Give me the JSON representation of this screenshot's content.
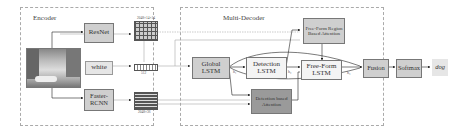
{
  "encoder": {
    "title": "Encoder",
    "resnet_label": "ResNet",
    "text_input_label": "white",
    "faster_rcnn_label": "Faster-RCNN",
    "feature_map_dim": "2048×14×14",
    "word_embed_dim": "512",
    "region_feature_dim": "2048×36"
  },
  "decoder": {
    "title": "Multi-Decoder",
    "global_lstm_label": "Global LSTM",
    "detection_lstm_label": "Detection LSTM",
    "freeform_lstm_label": "Free-Form LSTM",
    "freeform_attention_label": "Free-Form Region Based Attention",
    "detection_attention_label": "Detection based Attention",
    "fusion_label": "Fusion",
    "softmax_label": "Softmax",
    "output_word": "dog",
    "h_global": "h₁",
    "h_detection": "h₂",
    "h_freeform": "h₃",
    "h_global_out": "h₁ᵗ",
    "h_detection_out": "h₂ᵗ",
    "h_freeform_out": "h₃ᵗ"
  }
}
